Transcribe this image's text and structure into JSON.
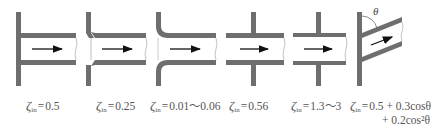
{
  "figure": {
    "colors": {
      "wall": "#6e6e6e",
      "wall_stroke": "#555555",
      "pipe_interior": "#ffffff",
      "arrow": "#111111",
      "text": "#555555"
    },
    "symbol": "ζ",
    "subscript": "in",
    "angle_symbol": "θ",
    "diagrams": [
      {
        "id": "sharp-edged",
        "zeta_value": "0.5"
      },
      {
        "id": "chamfered",
        "zeta_value": "0.25"
      },
      {
        "id": "bell-mouth",
        "zeta_value": "0.01～0.06"
      },
      {
        "id": "flush-flange-reentrant",
        "zeta_value": "0.56"
      },
      {
        "id": "protruding-reentrant",
        "zeta_value": "1.3～3"
      },
      {
        "id": "inclined",
        "zeta_value": "0.5 + 0.3cosθ",
        "zeta_value_line2": "+ 0.2cos²θ"
      }
    ]
  }
}
